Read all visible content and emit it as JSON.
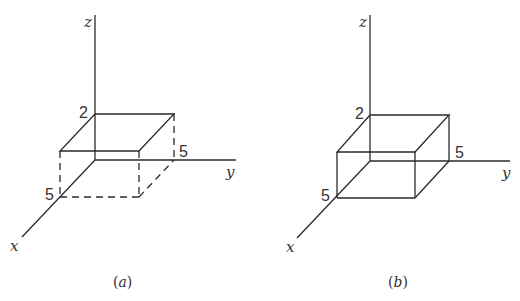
{
  "figures": [
    {
      "id": "a",
      "caption_open": "(",
      "caption_letter": "a",
      "caption_close": ")",
      "axis_labels": {
        "x": "x",
        "y": "y",
        "z": "z"
      },
      "dimension_labels": {
        "height": "2",
        "width_y": "5",
        "depth_x": "5"
      },
      "box": {
        "x_extent": 5,
        "y_extent": 5,
        "z_extent": 2
      },
      "hidden_edges_style": "dashed (lower portion of box below the top face)"
    },
    {
      "id": "b",
      "caption_open": "(",
      "caption_letter": "b",
      "caption_close": ")",
      "axis_labels": {
        "x": "x",
        "y": "y",
        "z": "z"
      },
      "dimension_labels": {
        "height": "2",
        "width_y": "5",
        "depth_x": "5"
      },
      "box": {
        "x_extent": 5,
        "y_extent": 5,
        "z_extent": 2
      },
      "hidden_edges_style": "solid"
    }
  ],
  "colors": {
    "line": "#2a2a2a",
    "text": "#333333",
    "background": "#ffffff"
  }
}
